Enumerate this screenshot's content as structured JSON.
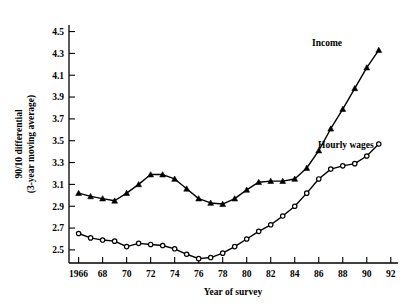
{
  "chart_data": {
    "type": "line",
    "title": "",
    "xlabel": "Year of survey",
    "ylabel": "90/10 differential (3-year moving average)",
    "ylabel_line1": "90/10 differential",
    "ylabel_line2": "(3-year moving average)",
    "xlim": [
      1965.2,
      1992.6
    ],
    "ylim": [
      2.38,
      4.56
    ],
    "grid": false,
    "legend_position": "inline-annotation",
    "y_ticks": [
      2.5,
      2.7,
      2.9,
      3.1,
      3.3,
      3.5,
      3.7,
      3.9,
      4.1,
      4.3,
      4.5
    ],
    "y_tick_labels": [
      "2.5",
      "2.7",
      "2.9",
      "3.1",
      "3.3",
      "3.5",
      "3.7",
      "3.9",
      "4.1",
      "4.3",
      "4.5"
    ],
    "x_ticks": [
      1966,
      1968,
      1970,
      1972,
      1974,
      1976,
      1978,
      1980,
      1982,
      1984,
      1986,
      1988,
      1990,
      1992
    ],
    "x_tick_labels": [
      "1966",
      "68",
      "70",
      "72",
      "74",
      "76",
      "78",
      "80",
      "82",
      "84",
      "86",
      "88",
      "90",
      "92"
    ],
    "x": [
      1966,
      1967,
      1968,
      1969,
      1970,
      1971,
      1972,
      1973,
      1974,
      1975,
      1976,
      1977,
      1978,
      1979,
      1980,
      1981,
      1982,
      1983,
      1984,
      1985,
      1986,
      1987,
      1988,
      1989,
      1990,
      1991
    ],
    "series": [
      {
        "name": "Income",
        "marker": "triangle",
        "annotation": "Income",
        "values": [
          3.02,
          2.99,
          2.97,
          2.95,
          3.02,
          3.1,
          3.19,
          3.19,
          3.15,
          3.06,
          2.97,
          2.93,
          2.92,
          2.97,
          3.05,
          3.12,
          3.13,
          3.13,
          3.15,
          3.25,
          3.41,
          3.61,
          3.79,
          3.98,
          4.17,
          4.33
        ]
      },
      {
        "name": "Hourly wages",
        "marker": "circle",
        "annotation": "Hourly wages",
        "values": [
          2.65,
          2.61,
          2.59,
          2.58,
          2.53,
          2.56,
          2.55,
          2.54,
          2.51,
          2.46,
          2.42,
          2.43,
          2.47,
          2.53,
          2.6,
          2.67,
          2.73,
          2.81,
          2.9,
          3.02,
          3.15,
          3.24,
          3.27,
          3.29,
          3.36,
          3.47
        ]
      }
    ]
  },
  "axis": {
    "x_title": "Year of survey",
    "y_title_line1": "90/10 differential",
    "y_title_line2": "(3-year moving average)"
  },
  "annotations": {
    "income": "Income",
    "hourly_wages": "Hourly wages"
  }
}
